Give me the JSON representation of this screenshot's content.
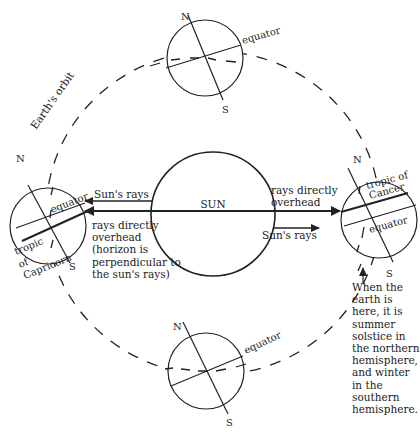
{
  "diagram": {
    "type": "earth-orbit-seasons",
    "orbit_label": "Earth's orbit",
    "sun_label": "SUN",
    "earths": {
      "top": {
        "north": "N",
        "south": "S",
        "equator": "equator"
      },
      "bottom": {
        "north": "N",
        "south": "S",
        "equator": "equator"
      },
      "left": {
        "north": "N",
        "south": "S",
        "equator": "equator",
        "tropic_lines": [
          "tropic",
          "of",
          "Capricorn"
        ]
      },
      "right": {
        "north": "N",
        "south": "S",
        "equator": "equator",
        "tropic_lines": [
          "tropic of",
          "Cancer"
        ]
      }
    },
    "left_rays": {
      "upper_label": "Sun's rays",
      "lower_label_lines": [
        "rays directly",
        "overhead",
        "(horizon is",
        "perpendicular to",
        "the sun's rays)"
      ]
    },
    "right_rays": {
      "upper_label_lines": [
        "rays directly",
        "overhead"
      ],
      "lower_label": "Sun's rays"
    },
    "note_lines": [
      "When the",
      "earth is",
      "here, it is",
      "summer",
      "solstice in",
      "the northern",
      "hemisphere,",
      "and winter",
      "in the",
      "southern",
      "hemisphere."
    ],
    "colors": {
      "line": "#222222",
      "background": "#ffffff"
    }
  }
}
